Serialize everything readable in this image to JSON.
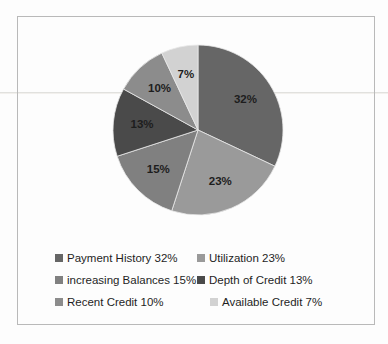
{
  "chart_data": {
    "type": "pie",
    "title": "",
    "categories": [
      "Payment History",
      "Utilization",
      "increasing Balances",
      "Depth of Credit",
      "Recent Credit",
      "Available Credit"
    ],
    "values": [
      32,
      23,
      15,
      13,
      10,
      7
    ],
    "value_labels": [
      "32%",
      "23%",
      "15%",
      "13%",
      "10%",
      "7%"
    ],
    "colors": [
      "#666666",
      "#9a9a9a",
      "#808080",
      "#4a4a4a",
      "#8c8c8c",
      "#d2d2d2"
    ],
    "legend_position": "bottom",
    "legend_columns": 2,
    "start_angle": 0,
    "direction": "clockwise",
    "units": "percent"
  },
  "slices": [
    {
      "label": "Payment History",
      "value_label": "32%",
      "value": 32,
      "color": "#666666"
    },
    {
      "label": "Utilization",
      "value_label": "23%",
      "value": 23,
      "color": "#9a9a9a"
    },
    {
      "label": "increasing Balances",
      "value_label": "15%",
      "value": 15,
      "color": "#808080"
    },
    {
      "label": "Depth of Credit",
      "value_label": "13%",
      "value": 13,
      "color": "#4a4a4a"
    },
    {
      "label": "Recent Credit",
      "value_label": "10%",
      "value": 10,
      "color": "#8c8c8c"
    },
    {
      "label": "Available Credit",
      "value_label": "7%",
      "value": 7,
      "color": "#d2d2d2"
    }
  ],
  "legend": {
    "rows": [
      {
        "left": {
          "text": "Payment History 32%",
          "color": "#666666"
        },
        "right": {
          "text": "Utilization 23%",
          "color": "#9a9a9a"
        }
      },
      {
        "left": {
          "text": "increasing Balances 15%",
          "color": "#808080"
        },
        "right": {
          "text": "Depth of Credit 13%",
          "color": "#4a4a4a"
        }
      },
      {
        "left": {
          "text": "Recent Credit 10%",
          "color": "#8c8c8c"
        },
        "right": {
          "text": "Available Credit 7%",
          "color": "#d2d2d2"
        }
      }
    ]
  }
}
